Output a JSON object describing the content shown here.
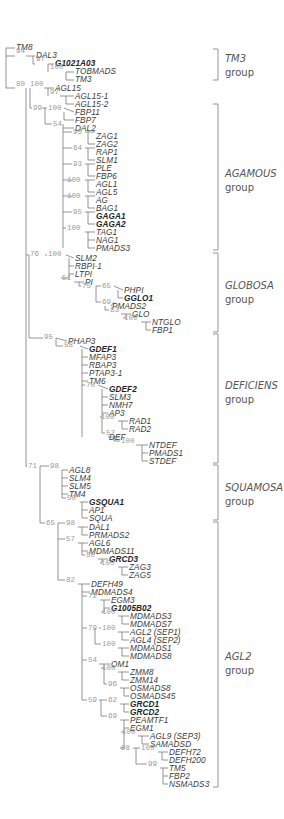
{
  "figure": {
    "type": "phylogenetic-tree",
    "taxa": [
      {
        "name": "TM8",
        "x": 16,
        "y": 48,
        "bold": false
      },
      {
        "name": "DAL3",
        "x": 36,
        "y": 56,
        "bold": false
      },
      {
        "name": "G1021A03",
        "x": 55,
        "y": 64,
        "bold": true
      },
      {
        "name": "TOBMADS",
        "x": 75,
        "y": 72,
        "bold": false
      },
      {
        "name": "TM3",
        "x": 75,
        "y": 80,
        "bold": false
      },
      {
        "name": "AGL15",
        "x": 55,
        "y": 89,
        "bold": false
      },
      {
        "name": "AGL15-1",
        "x": 75,
        "y": 97,
        "bold": false
      },
      {
        "name": "AGL15-2",
        "x": 75,
        "y": 105,
        "bold": false
      },
      {
        "name": "FBP11",
        "x": 75,
        "y": 113,
        "bold": false
      },
      {
        "name": "FBP7",
        "x": 75,
        "y": 121,
        "bold": false
      },
      {
        "name": "DAL2",
        "x": 75,
        "y": 129,
        "bold": false
      },
      {
        "name": "ZAG1",
        "x": 96,
        "y": 137,
        "bold": false
      },
      {
        "name": "ZAG2",
        "x": 96,
        "y": 145,
        "bold": false
      },
      {
        "name": "RAP1",
        "x": 96,
        "y": 153,
        "bold": false
      },
      {
        "name": "SLM1",
        "x": 96,
        "y": 161,
        "bold": false
      },
      {
        "name": "PLE",
        "x": 96,
        "y": 169,
        "bold": false
      },
      {
        "name": "FBP6",
        "x": 96,
        "y": 177,
        "bold": false
      },
      {
        "name": "AGL1",
        "x": 96,
        "y": 185,
        "bold": false
      },
      {
        "name": "AGL5",
        "x": 96,
        "y": 193,
        "bold": false
      },
      {
        "name": "AG",
        "x": 96,
        "y": 201,
        "bold": false
      },
      {
        "name": "BAG1",
        "x": 96,
        "y": 209,
        "bold": false
      },
      {
        "name": "GAGA1",
        "x": 96,
        "y": 217,
        "bold": true
      },
      {
        "name": "GAGA2",
        "x": 96,
        "y": 225,
        "bold": true
      },
      {
        "name": "TAG1",
        "x": 96,
        "y": 233,
        "bold": false
      },
      {
        "name": "NAG1",
        "x": 96,
        "y": 241,
        "bold": false
      },
      {
        "name": "PMADS3",
        "x": 96,
        "y": 249,
        "bold": false
      },
      {
        "name": "SLM2",
        "x": 75,
        "y": 259,
        "bold": false
      },
      {
        "name": "RBPI-1",
        "x": 75,
        "y": 267,
        "bold": false
      },
      {
        "name": "LTPI",
        "x": 75,
        "y": 275,
        "bold": false
      },
      {
        "name": "PI",
        "x": 85,
        "y": 283,
        "bold": false
      },
      {
        "name": "PHPI",
        "x": 124,
        "y": 291,
        "bold": false
      },
      {
        "name": "GGLO1",
        "x": 124,
        "y": 299,
        "bold": true
      },
      {
        "name": "PMADS2",
        "x": 112,
        "y": 307,
        "bold": false
      },
      {
        "name": "GLO",
        "x": 132,
        "y": 315,
        "bold": false
      },
      {
        "name": "NTGLO",
        "x": 152,
        "y": 323,
        "bold": false
      },
      {
        "name": "FBP1",
        "x": 152,
        "y": 331,
        "bold": false
      },
      {
        "name": "PHAP3",
        "x": 68,
        "y": 342,
        "bold": false
      },
      {
        "name": "GDEF1",
        "x": 89,
        "y": 350,
        "bold": true
      },
      {
        "name": "MFAP3",
        "x": 89,
        "y": 358,
        "bold": false
      },
      {
        "name": "RBAP3",
        "x": 89,
        "y": 366,
        "bold": false
      },
      {
        "name": "PTAP3-1",
        "x": 89,
        "y": 374,
        "bold": false
      },
      {
        "name": "TM6",
        "x": 89,
        "y": 382,
        "bold": false
      },
      {
        "name": "GDEF2",
        "x": 109,
        "y": 390,
        "bold": true
      },
      {
        "name": "SLM3",
        "x": 109,
        "y": 398,
        "bold": false
      },
      {
        "name": "NMH7",
        "x": 109,
        "y": 406,
        "bold": false
      },
      {
        "name": "AP3",
        "x": 109,
        "y": 414,
        "bold": false
      },
      {
        "name": "RAD1",
        "x": 129,
        "y": 422,
        "bold": false
      },
      {
        "name": "RAD2",
        "x": 129,
        "y": 430,
        "bold": false
      },
      {
        "name": "DEF",
        "x": 109,
        "y": 438,
        "bold": false
      },
      {
        "name": "NTDEF",
        "x": 149,
        "y": 446,
        "bold": false
      },
      {
        "name": "PMADS1",
        "x": 149,
        "y": 454,
        "bold": false
      },
      {
        "name": "STDEF",
        "x": 149,
        "y": 462,
        "bold": false
      },
      {
        "name": "AGL8",
        "x": 69,
        "y": 471,
        "bold": false
      },
      {
        "name": "SLM4",
        "x": 69,
        "y": 479,
        "bold": false
      },
      {
        "name": "SLM5",
        "x": 69,
        "y": 487,
        "bold": false
      },
      {
        "name": "TM4",
        "x": 69,
        "y": 495,
        "bold": false
      },
      {
        "name": "GSQUA1",
        "x": 89,
        "y": 503,
        "bold": true
      },
      {
        "name": "AP1",
        "x": 89,
        "y": 511,
        "bold": false
      },
      {
        "name": "SQUA",
        "x": 89,
        "y": 519,
        "bold": false
      },
      {
        "name": "DAL1",
        "x": 89,
        "y": 528,
        "bold": false
      },
      {
        "name": "PRMADS2",
        "x": 89,
        "y": 536,
        "bold": false
      },
      {
        "name": "AGL6",
        "x": 89,
        "y": 544,
        "bold": false
      },
      {
        "name": "MDMADS11",
        "x": 89,
        "y": 552,
        "bold": false
      },
      {
        "name": "GRCD3",
        "x": 109,
        "y": 560,
        "bold": true
      },
      {
        "name": "ZAG3",
        "x": 129,
        "y": 568,
        "bold": false
      },
      {
        "name": "ZAG5",
        "x": 129,
        "y": 576,
        "bold": false
      },
      {
        "name": "DEFH49",
        "x": 91,
        "y": 585,
        "bold": false
      },
      {
        "name": "MDMADS4",
        "x": 91,
        "y": 593,
        "bold": false
      },
      {
        "name": "EGM3",
        "x": 111,
        "y": 601,
        "bold": false
      },
      {
        "name": "G1005B02",
        "x": 111,
        "y": 609,
        "bold": true
      },
      {
        "name": "MDMADS3",
        "x": 130,
        "y": 617,
        "bold": false
      },
      {
        "name": "MDMADS7",
        "x": 130,
        "y": 625,
        "bold": false
      },
      {
        "name": "AGL2 (SEP1)",
        "x": 130,
        "y": 633,
        "bold": false
      },
      {
        "name": "AGL4 (SEP2)",
        "x": 130,
        "y": 641,
        "bold": false
      },
      {
        "name": "MDMADS1",
        "x": 130,
        "y": 649,
        "bold": false
      },
      {
        "name": "MDMADS8",
        "x": 130,
        "y": 657,
        "bold": false
      },
      {
        "name": "OM1",
        "x": 111,
        "y": 665,
        "bold": false
      },
      {
        "name": "ZMM8",
        "x": 130,
        "y": 673,
        "bold": false
      },
      {
        "name": "ZMM14",
        "x": 130,
        "y": 681,
        "bold": false
      },
      {
        "name": "OSMADS8",
        "x": 130,
        "y": 689,
        "bold": false
      },
      {
        "name": "OSMADS45",
        "x": 130,
        "y": 697,
        "bold": false
      },
      {
        "name": "GRCD1",
        "x": 130,
        "y": 705,
        "bold": true
      },
      {
        "name": "GRCD2",
        "x": 130,
        "y": 713,
        "bold": true
      },
      {
        "name": "PEAMTF1",
        "x": 130,
        "y": 721,
        "bold": false
      },
      {
        "name": "EGM1",
        "x": 130,
        "y": 729,
        "bold": false
      },
      {
        "name": "AGL9 (SEP3)",
        "x": 150,
        "y": 737,
        "bold": false
      },
      {
        "name": "SAMADSD",
        "x": 150,
        "y": 745,
        "bold": false
      },
      {
        "name": "DEFH72",
        "x": 169,
        "y": 753,
        "bold": false
      },
      {
        "name": "DEFH200",
        "x": 169,
        "y": 761,
        "bold": false
      },
      {
        "name": "TM5",
        "x": 169,
        "y": 769,
        "bold": false
      },
      {
        "name": "FBP2",
        "x": 169,
        "y": 777,
        "bold": false
      },
      {
        "name": "NSMADS3",
        "x": 169,
        "y": 785,
        "bold": false
      }
    ],
    "bootstrap": [
      {
        "v": "94",
        "x": 16,
        "y": 52
      },
      {
        "v": "97",
        "x": 36,
        "y": 60
      },
      {
        "v": "100",
        "x": 50,
        "y": 68
      },
      {
        "v": "80",
        "x": 16,
        "y": 85
      },
      {
        "v": "100",
        "x": 30,
        "y": 85
      },
      {
        "v": "97",
        "x": 50,
        "y": 93
      },
      {
        "v": "99",
        "x": 33,
        "y": 109
      },
      {
        "v": "100",
        "x": 48,
        "y": 109
      },
      {
        "v": "54",
        "x": 53,
        "y": 125
      },
      {
        "v": "95",
        "x": 73,
        "y": 133
      },
      {
        "v": "64",
        "x": 73,
        "y": 149
      },
      {
        "v": "93",
        "x": 73,
        "y": 165
      },
      {
        "v": "100",
        "x": 67,
        "y": 181
      },
      {
        "v": "100",
        "x": 67,
        "y": 197
      },
      {
        "v": "95",
        "x": 73,
        "y": 213
      },
      {
        "v": "100",
        "x": 67,
        "y": 229
      },
      {
        "v": "76",
        "x": 30,
        "y": 255
      },
      {
        "v": "100",
        "x": 48,
        "y": 255
      },
      {
        "v": "51",
        "x": 62,
        "y": 279
      },
      {
        "v": "75",
        "x": 82,
        "y": 287
      },
      {
        "v": "65",
        "x": 102,
        "y": 287
      },
      {
        "v": "69",
        "x": 102,
        "y": 303
      },
      {
        "v": "83",
        "x": 110,
        "y": 311
      },
      {
        "v": "100",
        "x": 124,
        "y": 319
      },
      {
        "v": "95",
        "x": 44,
        "y": 338
      },
      {
        "v": "58",
        "x": 64,
        "y": 346
      },
      {
        "v": "70",
        "x": 86,
        "y": 386
      },
      {
        "v": "100",
        "x": 101,
        "y": 418
      },
      {
        "v": "52",
        "x": 106,
        "y": 434
      },
      {
        "v": "100",
        "x": 121,
        "y": 442
      },
      {
        "v": "71",
        "x": 28,
        "y": 467
      },
      {
        "v": "98",
        "x": 50,
        "y": 467
      },
      {
        "v": "50",
        "x": 67,
        "y": 499
      },
      {
        "v": "65",
        "x": 46,
        "y": 524
      },
      {
        "v": "98",
        "x": 66,
        "y": 524
      },
      {
        "v": "57",
        "x": 66,
        "y": 540
      },
      {
        "v": "50",
        "x": 86,
        "y": 556
      },
      {
        "v": "100",
        "x": 101,
        "y": 564
      },
      {
        "v": "82",
        "x": 66,
        "y": 581
      },
      {
        "v": "72",
        "x": 88,
        "y": 597
      },
      {
        "v": "100",
        "x": 102,
        "y": 613
      },
      {
        "v": "79",
        "x": 88,
        "y": 629
      },
      {
        "v": "100",
        "x": 102,
        "y": 629
      },
      {
        "v": "100",
        "x": 102,
        "y": 645
      },
      {
        "v": "54",
        "x": 88,
        "y": 661
      },
      {
        "v": "100",
        "x": 102,
        "y": 669
      },
      {
        "v": "96",
        "x": 108,
        "y": 685
      },
      {
        "v": "59",
        "x": 88,
        "y": 701
      },
      {
        "v": "62",
        "x": 108,
        "y": 701
      },
      {
        "v": "69",
        "x": 108,
        "y": 717
      },
      {
        "v": "100",
        "x": 122,
        "y": 733
      },
      {
        "v": "98",
        "x": 121,
        "y": 749
      },
      {
        "v": "100",
        "x": 141,
        "y": 749
      },
      {
        "v": "99",
        "x": 148,
        "y": 765
      }
    ],
    "groups": [
      {
        "name": "TM3",
        "word": "group",
        "top": 49,
        "bottom": 80,
        "labelY": 52
      },
      {
        "name": "AGAMOUS",
        "word": "group",
        "top": 104,
        "bottom": 250,
        "labelY": 167
      },
      {
        "name": "GLOBOSA",
        "word": "group",
        "top": 253,
        "bottom": 332,
        "labelY": 279
      },
      {
        "name": "DEFICIENS",
        "word": "group",
        "top": 334,
        "bottom": 463,
        "labelY": 379
      },
      {
        "name": "SQUAMOSA",
        "word": "group",
        "top": 465,
        "bottom": 520,
        "labelY": 481
      },
      {
        "name": "AGL2",
        "word": "group",
        "top": 522,
        "bottom": 787,
        "labelY": 650
      }
    ]
  }
}
